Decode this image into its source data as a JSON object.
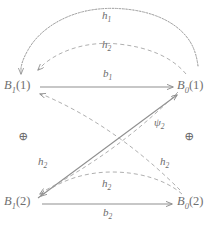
{
  "diagram": {
    "type": "signal-flow-graph",
    "background_color": "#ffffff",
    "stroke_color": "#8a8a8a",
    "text_color": "#6b6b6b",
    "nodes": [
      {
        "id": "B1_1",
        "base": "B",
        "sub": "1",
        "arg": "(1)",
        "text": "B1(1)",
        "x": 34,
        "y": 86
      },
      {
        "id": "B0_1",
        "base": "B",
        "sub": "0",
        "arg": "(1)",
        "text": "B0(1)",
        "x": 186,
        "y": 86
      },
      {
        "id": "B1_2",
        "base": "B",
        "sub": "1",
        "arg": "(2)",
        "text": "B1(2)",
        "x": 34,
        "y": 202
      },
      {
        "id": "B0_2",
        "base": "B",
        "sub": "0",
        "arg": "(2)",
        "text": "B0(2)",
        "x": 186,
        "y": 202
      }
    ],
    "edge_labels": [
      {
        "id": "h1_top",
        "base": "h",
        "sub": "1",
        "text": "h1",
        "x": 108,
        "y": 17
      },
      {
        "id": "h2_top",
        "base": "h",
        "sub": "2",
        "text": "h2",
        "x": 108,
        "y": 46
      },
      {
        "id": "b1_mid",
        "base": "b",
        "sub": "1",
        "text": "b1",
        "x": 108,
        "y": 75
      },
      {
        "id": "psi2_diag",
        "base": "ψ",
        "sub": "2",
        "text": "psi2",
        "x": 160,
        "y": 124
      },
      {
        "id": "h2_left",
        "base": "h",
        "sub": "2",
        "text": "h2",
        "x": 44,
        "y": 163
      },
      {
        "id": "h2_right",
        "base": "h",
        "sub": "2",
        "text": "h2",
        "x": 166,
        "y": 163
      },
      {
        "id": "h2_lower",
        "base": "h",
        "sub": "2",
        "text": "h2",
        "x": 108,
        "y": 185
      },
      {
        "id": "b2_bottom",
        "base": "b",
        "sub": "2",
        "text": "b2",
        "x": 108,
        "y": 214
      }
    ],
    "operators": [
      {
        "id": "plus_left",
        "symbol": "⊕",
        "x": 24,
        "y": 137
      },
      {
        "id": "plus_right",
        "symbol": "⊕",
        "x": 190,
        "y": 137
      }
    ],
    "edges": [
      {
        "id": "edge-h1",
        "from": "B0_1",
        "to": "B1_1",
        "style": "wavy",
        "label": "h1"
      },
      {
        "id": "edge-h2-top",
        "from": "B0_1",
        "to": "B1_1",
        "style": "dashed",
        "label": "h2"
      },
      {
        "id": "edge-b1",
        "from": "B1_1",
        "to": "B0_1",
        "style": "solid",
        "label": "b1"
      },
      {
        "id": "edge-psi2",
        "from": "B1_2",
        "to": "B0_1",
        "style": "solid",
        "label": "psi2"
      },
      {
        "id": "edge-h2-left",
        "from": "B0_1",
        "to": "B1_2",
        "style": "dashed",
        "label": "h2"
      },
      {
        "id": "edge-h2-right",
        "from": "B0_2",
        "to": "B1_1",
        "style": "dashed",
        "label": "h2"
      },
      {
        "id": "edge-h2-lower",
        "from": "B0_2",
        "to": "B1_2",
        "style": "dashed",
        "label": "h2"
      },
      {
        "id": "edge-b2",
        "from": "B1_2",
        "to": "B0_2",
        "style": "solid",
        "label": "b2"
      }
    ]
  }
}
